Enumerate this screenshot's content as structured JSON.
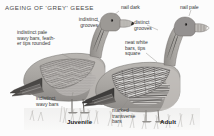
{
  "plate": {
    "title": "AGEING OF 'GREY' GEESE",
    "background_color": "#fcfcfc",
    "text_color": "#3b3b3b",
    "subject": "grey goose",
    "style": "monochrome pencil field-guide illustration"
  },
  "age_captions": [
    {
      "id": "juvenile",
      "label": "Juvenile"
    },
    {
      "id": "adult",
      "label": "Adult"
    }
  ],
  "labels": [
    {
      "id": "indistinct-pale-wavy-bars",
      "text": "indistinct pale\nwavy bars, feath-\ner tips rounded",
      "side": "left",
      "refers_to": "juvenile-wing-coverts"
    },
    {
      "id": "indistinct-grooves",
      "text": "indistinct\ngrooves",
      "side": "left",
      "refers_to": "juvenile-bill"
    },
    {
      "id": "nail-dark",
      "text": "nail dark",
      "side": "top",
      "refers_to": "juvenile-bill-nail"
    },
    {
      "id": "indistinct-wavy-bars",
      "text": "indistinct\nwavy bars",
      "side": "bottom-left",
      "refers_to": "juvenile-flank"
    },
    {
      "id": "nail-pale",
      "text": "nail pale",
      "side": "top-right",
      "refers_to": "adult-bill-nail"
    },
    {
      "id": "distinct-grooves",
      "text": "distinct\ngrooves",
      "side": "right",
      "refers_to": "adult-bill"
    },
    {
      "id": "neat-white-bars",
      "text": "neat white\nbars, tips\nsquare",
      "side": "right",
      "refers_to": "adult-wing-coverts"
    },
    {
      "id": "marked-transverse-bars",
      "text": "marked\ntransverse\nbars",
      "side": "bottom",
      "refers_to": "adult-flank"
    }
  ],
  "figures": [
    {
      "id": "juvenile-goose",
      "age": "Juvenile"
    },
    {
      "id": "adult-goose",
      "age": "Adult"
    }
  ]
}
